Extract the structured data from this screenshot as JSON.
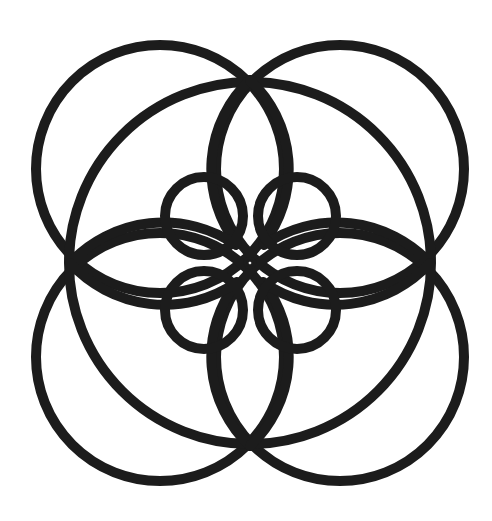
{
  "figure": {
    "width": 492,
    "height": 521,
    "background": "#ffffff",
    "stroke_color": "#1c1c1c",
    "stroke_width": 10,
    "center_dot": {
      "cx": 250,
      "cy": 263,
      "r": 5,
      "stroke_width": 2.5
    },
    "central_circle": {
      "cx": 250,
      "cy": 263,
      "r": 181
    },
    "outer_circles": [
      {
        "name": "outer-circle-top-left",
        "cx": 160,
        "cy": 169,
        "r": 124
      },
      {
        "name": "outer-circle-top-right",
        "cx": 340,
        "cy": 169,
        "r": 124
      },
      {
        "name": "outer-circle-bottom-left",
        "cx": 160,
        "cy": 357,
        "r": 124
      },
      {
        "name": "outer-circle-bottom-right",
        "cx": 340,
        "cy": 357,
        "r": 124
      }
    ],
    "inner_circles": [
      {
        "name": "inner-circle-top-left",
        "cx": 204,
        "cy": 216,
        "r": 39
      },
      {
        "name": "inner-circle-top-right",
        "cx": 297,
        "cy": 216,
        "r": 39
      },
      {
        "name": "inner-circle-bottom-left",
        "cx": 204,
        "cy": 310,
        "r": 39
      },
      {
        "name": "inner-circle-bottom-right",
        "cx": 297,
        "cy": 310,
        "r": 39
      }
    ],
    "petal_arcs": [
      {
        "name": "petal-top-left-arc",
        "d": "M 250 80 A 122 122 0 0 0 237 244"
      },
      {
        "name": "petal-top-right-arc",
        "d": "M 250 80 A 122 122 0 0 1 263 244"
      },
      {
        "name": "petal-bottom-left-arc",
        "d": "M 250 446 A 122 122 0 0 1 237 282"
      },
      {
        "name": "petal-bottom-right-arc",
        "d": "M 250 446 A 122 122 0 0 0 263 282"
      },
      {
        "name": "petal-left-upper-arc",
        "d": "M 70 263 A 128 128 0 0 1 236 245"
      },
      {
        "name": "petal-left-lower-arc",
        "d": "M 70 263 A 128 128 0 0 0 236 283"
      },
      {
        "name": "petal-right-upper-arc",
        "d": "M 430 263 A 128 128 0 0 0 264 245"
      },
      {
        "name": "petal-right-lower-arc",
        "d": "M 430 263 A 128 128 0 0 1 264 283"
      }
    ]
  }
}
